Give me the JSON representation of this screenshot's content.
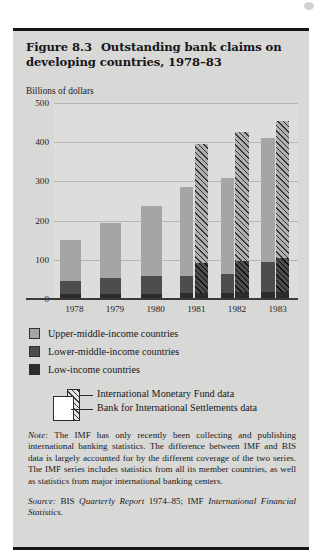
{
  "figure": {
    "number": "Figure 8.3",
    "title": "Outstanding bank claims on developing countries, 1978–83",
    "units_label": "Billions of dollars"
  },
  "legend": {
    "items": [
      {
        "key": "upper",
        "label": "Upper-middle-income countries",
        "color": "#a5a5a3"
      },
      {
        "key": "lower",
        "label": "Lower-middle-income countries",
        "color": "#4d4d50"
      },
      {
        "key": "low",
        "label": "Low-income countries",
        "color": "#2c2c2f"
      }
    ]
  },
  "source_key": {
    "imf_label": "International Monetary Fund data",
    "bis_label": "Bank for International Settlements data"
  },
  "note": {
    "lead": "Note:",
    "text": " The IMF has only recently been collecting and publishing international banking statistics. The difference between IMF and BIS data is largely accounted for by the different coverage of the two series. The IMF series includes statistics from all its member countries, as well as statistics from major international banking centers."
  },
  "source": {
    "lead": "Source:",
    "part1": " BIS ",
    "italic1": "Quarterly Report",
    "part2": " 1974–85; IMF ",
    "italic2": "International Financial Statistics",
    "part3": "."
  },
  "chart_data": {
    "type": "bar",
    "title": "Outstanding bank claims on developing countries, 1978–83",
    "xlabel": "",
    "ylabel": "Billions of dollars",
    "ylim": [
      0,
      500
    ],
    "yticks": [
      0,
      100,
      200,
      300,
      400,
      500
    ],
    "grid": true,
    "legend_position": "below",
    "categories": [
      "1978",
      "1979",
      "1980",
      "1981",
      "1982",
      "1983"
    ],
    "stack_order": [
      "Low-income countries",
      "Lower-middle-income countries",
      "Upper-middle-income countries"
    ],
    "sources": [
      "International Monetary Fund data",
      "Bank for International Settlements data"
    ],
    "groups": [
      {
        "year": "1978",
        "bars": [
          {
            "source": "International Monetary Fund data",
            "hatched": false,
            "total": 150,
            "segments": {
              "low": 12,
              "lower": 33,
              "upper": 105
            }
          }
        ]
      },
      {
        "year": "1979",
        "bars": [
          {
            "source": "International Monetary Fund data",
            "hatched": false,
            "total": 193,
            "segments": {
              "low": 13,
              "lower": 40,
              "upper": 140
            }
          }
        ]
      },
      {
        "year": "1980",
        "bars": [
          {
            "source": "International Monetary Fund data",
            "hatched": false,
            "total": 237,
            "segments": {
              "low": 14,
              "lower": 44,
              "upper": 179
            }
          }
        ]
      },
      {
        "year": "1981",
        "bars": [
          {
            "source": "International Monetary Fund data",
            "hatched": false,
            "total": 285,
            "segments": {
              "low": 15,
              "lower": 43,
              "upper": 227
            }
          },
          {
            "source": "Bank for International Settlements data",
            "hatched": true,
            "total": 395,
            "segments": {
              "low": 16,
              "lower": 76,
              "upper": 303
            }
          }
        ]
      },
      {
        "year": "1982",
        "bars": [
          {
            "source": "International Monetary Fund data",
            "hatched": false,
            "total": 308,
            "segments": {
              "low": 16,
              "lower": 49,
              "upper": 243
            }
          },
          {
            "source": "Bank for International Settlements data",
            "hatched": true,
            "total": 425,
            "segments": {
              "low": 17,
              "lower": 81,
              "upper": 327
            }
          }
        ]
      },
      {
        "year": "1983",
        "bars": [
          {
            "source": "International Monetary Fund data",
            "hatched": false,
            "total": 410,
            "segments": {
              "low": 18,
              "lower": 77,
              "upper": 315
            }
          },
          {
            "source": "Bank for International Settlements data",
            "hatched": true,
            "total": 455,
            "segments": {
              "low": 19,
              "lower": 86,
              "upper": 350
            }
          }
        ]
      }
    ]
  }
}
